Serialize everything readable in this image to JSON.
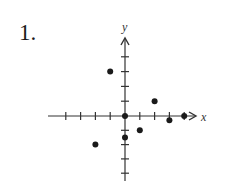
{
  "problem": {
    "number_label": "1."
  },
  "chart_data": {
    "type": "scatter",
    "title": "",
    "xlabel": "x",
    "ylabel": "y",
    "xlim": [
      -4.5,
      4.8
    ],
    "ylim": [
      -4.5,
      4.8
    ],
    "x_ticks": [
      -4,
      -3,
      -2,
      -1,
      1,
      2,
      3,
      4
    ],
    "y_ticks": [
      -4,
      -3,
      -2,
      -1,
      1,
      2,
      3,
      4
    ],
    "tick_labels_shown": false,
    "grid": false,
    "legend": null,
    "points": [
      {
        "x": 0,
        "y": 0
      },
      {
        "x": -1,
        "y": 3
      },
      {
        "x": 2,
        "y": 1
      },
      {
        "x": 3,
        "y": -0.3
      },
      {
        "x": 4,
        "y": 0
      },
      {
        "x": 1,
        "y": -1
      },
      {
        "x": 0,
        "y": -1.5
      },
      {
        "x": -2,
        "y": -2
      }
    ],
    "x": [
      0,
      -1,
      2,
      3,
      4,
      1,
      0,
      -2
    ],
    "y": [
      0,
      3,
      1,
      -0.3,
      0,
      -1,
      -1.5,
      -2
    ],
    "colors": {
      "axis": "#333333",
      "point": "#1a1a1a"
    }
  }
}
